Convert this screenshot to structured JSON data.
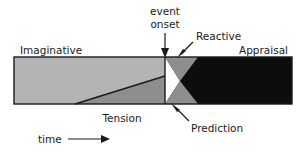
{
  "figure": {
    "title": "",
    "labels": {
      "imaginative": "Imaginative",
      "tension": "Tension",
      "appraisal": "Appraisal",
      "reactive": "Reactive",
      "prediction": "Prediction",
      "event_onset_line1": "event",
      "event_onset_line2": "onset",
      "time": "time"
    },
    "colors": {
      "light_gray": "#b4b4b4",
      "mid_gray": "#8e8e8e",
      "dark": "#0d0d0d",
      "outline": "#1a1a1a",
      "background": "#ffffff",
      "text": "#1a1a1a"
    },
    "geometry": {
      "plot_left": 14,
      "plot_right": 292,
      "plot_top": 57,
      "plot_bottom": 106,
      "onset_x": 165,
      "tension_apex_x": 75,
      "notch_x": 180,
      "notch_y": 81,
      "wedge_right_x": 198
    },
    "axis": {
      "x_label": "time",
      "x_direction": "left-to-right-arrow"
    }
  }
}
